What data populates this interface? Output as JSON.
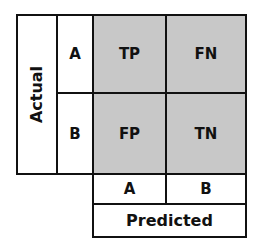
{
  "diagram": {
    "actual_label": "Actual",
    "predicted_label": "Predicted",
    "row_labels": [
      "A",
      "B"
    ],
    "col_labels": [
      "A",
      "B"
    ],
    "cells": [
      [
        "TP",
        "FN"
      ],
      [
        "FP",
        "TN"
      ]
    ],
    "colors": {
      "cell_fill": "#c8c8c8",
      "label_fill": "#ffffff",
      "border": "#111111"
    }
  }
}
